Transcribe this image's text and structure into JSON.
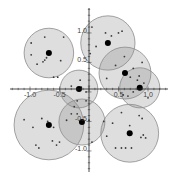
{
  "chart_data": {
    "type": "scatter",
    "title": "",
    "xlabel": "",
    "ylabel": "",
    "xlim": [
      -1.5,
      1.45
    ],
    "ylim": [
      -1.5,
      1.5
    ],
    "grid": false,
    "legend": null,
    "x_ticks": [
      -1.0,
      -0.5,
      0.5,
      1.0
    ],
    "y_ticks": [
      1.0,
      0.5,
      -0.5,
      -1.0
    ],
    "x_tick_labels": [
      "-1.0",
      "-0.5",
      "0.5",
      "1.0"
    ],
    "y_tick_labels": [
      "1.0",
      "0.5",
      "-0.5",
      "-1.0"
    ],
    "clusters": [
      {
        "center": [
          -0.68,
          0.61
        ],
        "radius": 0.42,
        "points": [
          [
            -0.98,
            0.78
          ],
          [
            -0.75,
            0.88
          ],
          [
            -0.43,
            0.88
          ],
          [
            -0.88,
            0.42
          ],
          [
            -0.72,
            0.53
          ],
          [
            -0.75,
            0.49
          ],
          [
            -0.78,
            0.46
          ],
          [
            -0.98,
            0.58
          ],
          [
            -0.6,
            0.2
          ],
          [
            -0.53,
            0.2
          ],
          [
            -0.48,
            0.48
          ]
        ]
      },
      {
        "center": [
          0.32,
          0.78
        ],
        "radius": 0.46,
        "points": [
          [
            0.05,
            1.05
          ],
          [
            0.28,
            0.95
          ],
          [
            0.38,
            0.9
          ],
          [
            0.5,
            0.95
          ],
          [
            0.56,
            0.98
          ],
          [
            0.12,
            0.72
          ],
          [
            0.02,
            0.6
          ]
        ]
      },
      {
        "center": [
          0.61,
          0.27
        ],
        "radius": 0.44,
        "points": [
          [
            0.6,
            0.55
          ],
          [
            0.45,
            0.4
          ],
          [
            0.75,
            0.35
          ],
          [
            0.85,
            0.22
          ],
          [
            0.3,
            0.18
          ],
          [
            0.9,
            0.45
          ]
        ]
      },
      {
        "center": [
          0.86,
          0.02
        ],
        "radius": 0.34,
        "points": [
          [
            0.7,
            0.2
          ],
          [
            0.82,
            0.15
          ],
          [
            0.58,
            -0.1
          ],
          [
            0.66,
            -0.12
          ],
          [
            0.75,
            -0.05
          ],
          [
            0.93,
            0.1
          ],
          [
            1.0,
            -0.15
          ]
        ]
      },
      {
        "center": [
          -0.17,
          0.0
        ],
        "radius": 0.32,
        "points": [
          [
            -0.15,
            0.15
          ],
          [
            -0.3,
            0.05
          ],
          [
            -0.05,
            -0.05
          ],
          [
            -0.2,
            -0.2
          ],
          [
            -0.05,
            -0.2
          ],
          [
            -0.25,
            -0.3
          ],
          [
            -0.13,
            0.03
          ]
        ]
      },
      {
        "center": [
          -0.68,
          -0.61
        ],
        "radius": 0.59,
        "points": [
          [
            -1.1,
            -0.52
          ],
          [
            -0.95,
            -0.65
          ],
          [
            -0.8,
            -0.5
          ],
          [
            -0.7,
            -0.55
          ],
          [
            -0.9,
            -0.95
          ],
          [
            -0.85,
            -1.0
          ],
          [
            -0.62,
            -0.88
          ],
          [
            -0.5,
            -0.9
          ],
          [
            -0.55,
            -0.95
          ],
          [
            -0.6,
            -0.65
          ]
        ]
      },
      {
        "center": [
          -0.12,
          -0.56
        ],
        "radius": 0.39,
        "points": [
          [
            -0.38,
            -0.53
          ],
          [
            -0.3,
            -0.42
          ],
          [
            -0.2,
            -0.42
          ],
          [
            0.0,
            -0.53
          ],
          [
            -0.1,
            -0.55
          ],
          [
            0.05,
            -0.9
          ],
          [
            0.25,
            -0.55
          ]
        ]
      },
      {
        "center": [
          0.69,
          -0.75
        ],
        "radius": 0.49,
        "points": [
          [
            0.55,
            -0.4
          ],
          [
            0.85,
            -0.45
          ],
          [
            0.9,
            -0.5
          ],
          [
            0.4,
            -0.58
          ],
          [
            0.69,
            -0.62
          ],
          [
            0.3,
            -0.8
          ],
          [
            0.88,
            -0.82
          ],
          [
            0.92,
            -0.78
          ],
          [
            0.96,
            -0.83
          ],
          [
            0.45,
            -1.0
          ],
          [
            0.55,
            -1.0
          ],
          [
            0.62,
            -1.0
          ],
          [
            0.72,
            -1.0
          ]
        ]
      }
    ]
  }
}
